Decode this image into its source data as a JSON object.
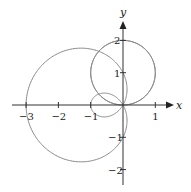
{
  "chart_data": {
    "type": "line",
    "title": "",
    "subtitle": "",
    "xlabel": "x",
    "ylabel": "y",
    "xlim": [
      -3.3,
      1.5
    ],
    "ylim": [
      -2.5,
      2.9
    ],
    "grid": false,
    "legend": null,
    "x_ticks": [
      {
        "value": -3,
        "label": "−3"
      },
      {
        "value": -2,
        "label": "−2"
      },
      {
        "value": -1,
        "label": "−1"
      },
      {
        "value": 1,
        "label": "1"
      }
    ],
    "y_ticks": [
      {
        "value": 2,
        "label": "2"
      },
      {
        "value": 1,
        "label": "1"
      },
      {
        "value": -1,
        "label": "−1"
      },
      {
        "value": -2,
        "label": "−2"
      }
    ],
    "series": [
      {
        "name": "circle r = 2 sinθ",
        "kind": "polar",
        "equation": "r = 2sin(theta)",
        "points_summary": {
          "center": [
            0,
            1
          ],
          "radius": 1,
          "passes_through": [
            [
              0,
              0
            ],
            [
              0,
              2
            ],
            [
              1,
              1
            ],
            [
              -1,
              1
            ]
          ]
        }
      },
      {
        "name": "limaçon r = 1 − 2 cosθ",
        "kind": "polar",
        "equation": "r = 1 - 2cos(theta)",
        "points_summary": {
          "outer_loop_leftmost": [
            -3,
            0
          ],
          "inner_loop_leftmost": [
            -1,
            0
          ],
          "passes_through_origin": true
        }
      }
    ],
    "style": {
      "curve_color": "#8a8a8a",
      "axis_color": "#333333"
    }
  }
}
